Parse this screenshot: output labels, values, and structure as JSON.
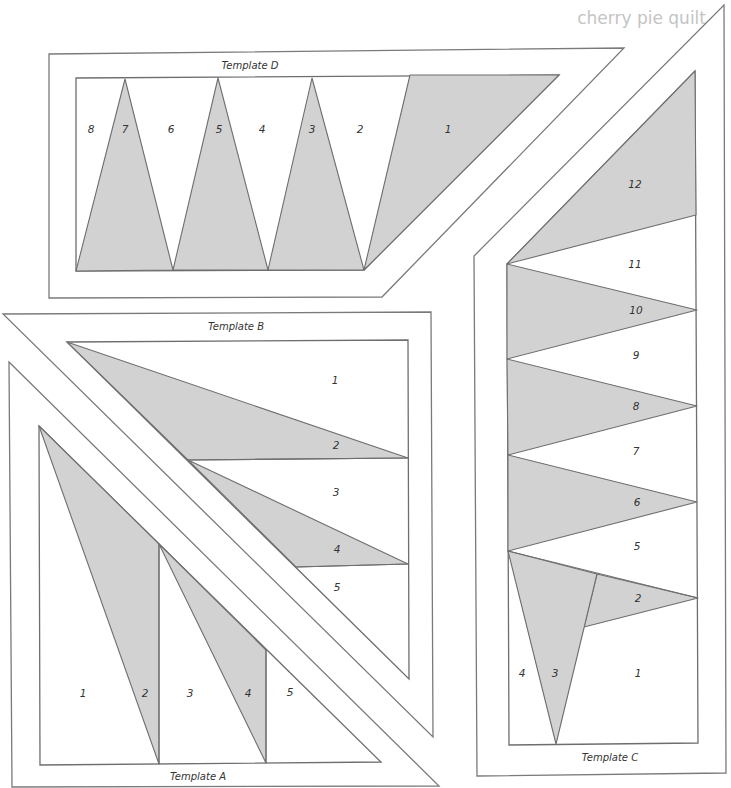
{
  "page": {
    "title": "cherry pie quilt",
    "colors": {
      "shaded_fabric": "#d2d2d2",
      "outline": "#6e6e6e",
      "title_text": "#c4c4c4"
    }
  },
  "templates": {
    "D": {
      "label": "Template D",
      "pieces": [
        "1",
        "2",
        "3",
        "4",
        "5",
        "6",
        "7",
        "8"
      ]
    },
    "B": {
      "label": "Template B",
      "pieces": [
        "1",
        "2",
        "3",
        "4",
        "5"
      ]
    },
    "A": {
      "label": "Template A",
      "pieces": [
        "1",
        "2",
        "3",
        "4",
        "5"
      ]
    },
    "C": {
      "label": "Template C",
      "pieces": [
        "1",
        "2",
        "3",
        "4",
        "5",
        "6",
        "7",
        "8",
        "9",
        "10",
        "11",
        "12"
      ]
    }
  }
}
